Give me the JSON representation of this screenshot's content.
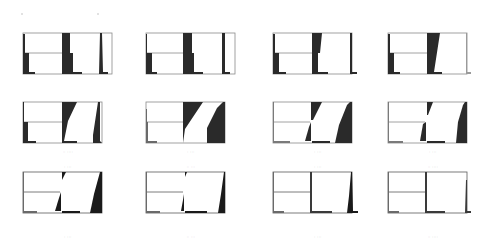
{
  "figure": {
    "colors": {
      "background": "#ffffff",
      "ink": "#2a2a2a",
      "frame": "#8a8a8a"
    },
    "rows": 3,
    "cols": 4,
    "panels": [
      {
        "row": 0,
        "col": 0,
        "x": 22,
        "y": 31,
        "caption": ""
      },
      {
        "row": 0,
        "col": 1,
        "x": 145,
        "y": 31,
        "caption": ""
      },
      {
        "row": 0,
        "col": 2,
        "x": 272,
        "y": 31,
        "caption": ""
      },
      {
        "row": 0,
        "col": 3,
        "x": 387,
        "y": 31,
        "caption": ""
      },
      {
        "row": 1,
        "col": 0,
        "x": 22,
        "y": 100,
        "caption": "·· ····"
      },
      {
        "row": 1,
        "col": 1,
        "x": 145,
        "y": 100,
        "caption": "· ···"
      },
      {
        "row": 1,
        "col": 2,
        "x": 272,
        "y": 100,
        "caption": "· ···"
      },
      {
        "row": 1,
        "col": 3,
        "x": 387,
        "y": 100,
        "caption": "· ···"
      },
      {
        "row": 2,
        "col": 0,
        "x": 22,
        "y": 170,
        "caption": "· ···"
      },
      {
        "row": 2,
        "col": 1,
        "x": 145,
        "y": 170,
        "caption": "·· ···"
      },
      {
        "row": 2,
        "col": 2,
        "x": 272,
        "y": 170,
        "caption": "· ···"
      },
      {
        "row": 2,
        "col": 3,
        "x": 387,
        "y": 170,
        "caption": "·· ····"
      }
    ]
  }
}
